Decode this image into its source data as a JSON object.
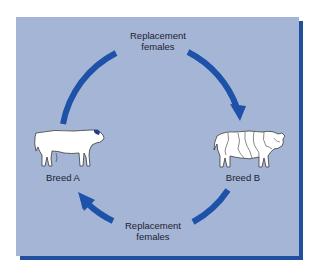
{
  "figure": {
    "type": "rotational crossbreeding cycle",
    "panel_color": "#a5b5d6",
    "shadow_color": "#1f4f9e",
    "arrow_color": "#1d52a8"
  },
  "nodes": [
    {
      "id": "breed-a",
      "label": "Breed A",
      "icon": "white-bull-icon",
      "position": "left"
    },
    {
      "id": "breed-b",
      "label": "Breed B",
      "icon": "spotted-bull-icon",
      "position": "right"
    }
  ],
  "edges": [
    {
      "from": "breed-a",
      "to": "breed-b",
      "path": "top",
      "label_line1": "Replacement",
      "label_line2": "females"
    },
    {
      "from": "breed-b",
      "to": "breed-a",
      "path": "bottom",
      "label_line1": "Replacement",
      "label_line2": "females"
    }
  ]
}
